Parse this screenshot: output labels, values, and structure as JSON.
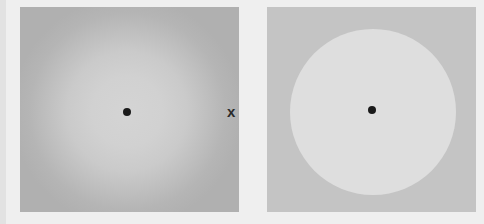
{
  "figure": {
    "left_panel": {
      "description": "blurred-edge light disk on gray background with central fixation dot",
      "background_color": "#b3b3b3",
      "disk_center_color": "#d4d4d4",
      "fixation_dot_color": "#1a1a1a"
    },
    "right_panel": {
      "description": "sharp-edged light disk on gray background with central fixation dot",
      "background_color": "#c4c4c4",
      "disk_color": "#dedede",
      "fixation_dot_color": "#1a1a1a"
    },
    "marker": {
      "label": "x",
      "icon": "x-mark"
    }
  }
}
